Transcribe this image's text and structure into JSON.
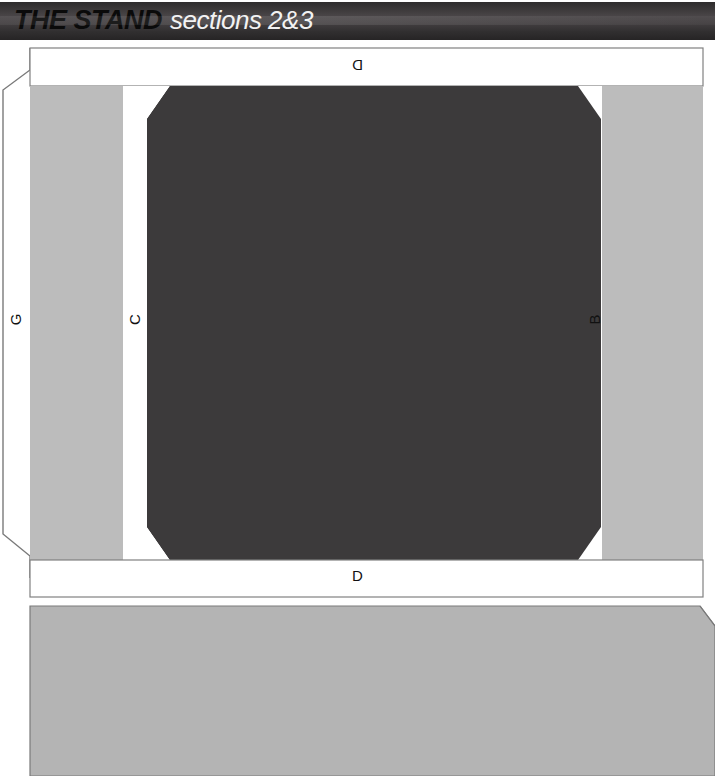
{
  "header": {
    "title": "THE STAND",
    "subtitle": "sections 2&3",
    "background_gradient_from": "#2e2c2d",
    "background_gradient_to": "#262425"
  },
  "diagram": {
    "name": "stand-seating-sections",
    "labels": {
      "d_top": "D",
      "d_bottom": "D",
      "g_left": "G",
      "c_mid": "C",
      "b_mid": "B"
    },
    "colors": {
      "dark_block": "#3c3a3b",
      "light_block": "#bcbcbc",
      "light_block_lower": "#b4b4b4",
      "outline": "#6e6e6e",
      "white": "#ffffff",
      "text": "#111111"
    }
  }
}
